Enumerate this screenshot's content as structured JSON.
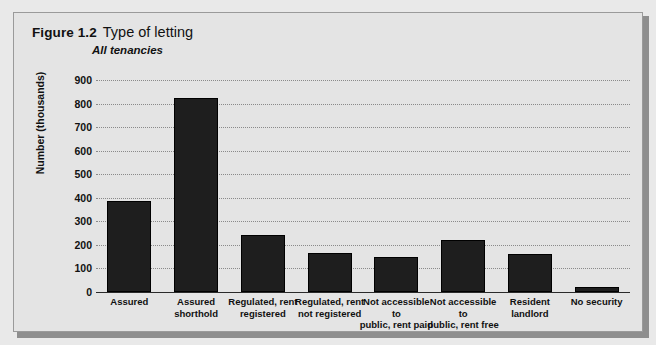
{
  "figure": {
    "number": "Figure 1.2",
    "title": "Type of letting",
    "subtitle": "All tenancies"
  },
  "colors": {
    "bar": "#1e1e1e",
    "panel_background": "#e4e4e4",
    "page_background": "#e9e9e9",
    "gridline": "#8a8a8a",
    "text": "#111111"
  },
  "chart_data": {
    "type": "bar",
    "title": "Type of letting",
    "subtitle": "All tenancies",
    "xlabel": "",
    "ylabel": "Number (thousands)",
    "ylim": [
      0,
      900
    ],
    "yticks": [
      0,
      100,
      200,
      300,
      400,
      500,
      600,
      700,
      800,
      900
    ],
    "ytick_labels": [
      "0",
      "100",
      "200",
      "300",
      "400",
      "500",
      "600",
      "700",
      "800",
      "900"
    ],
    "grid": true,
    "legend": false,
    "categories": [
      "Assured",
      "Assured shorthold",
      "Regulated, rent registered",
      "Regulated, rent not registered",
      "Not accessible to public, rent paid",
      "Not accessible to public, rent free",
      "Resident landlord",
      "No security"
    ],
    "category_lines": [
      [
        "Assured"
      ],
      [
        "Assured",
        "shorthold"
      ],
      [
        "Regulated, rent",
        "registered"
      ],
      [
        "Regulated, rent",
        "not registered"
      ],
      [
        "Not accessible to",
        "public, rent paid"
      ],
      [
        "Not accessible to",
        "public, rent free"
      ],
      [
        "Resident",
        "landlord"
      ],
      [
        "No security"
      ]
    ],
    "values": [
      385,
      825,
      240,
      165,
      150,
      220,
      160,
      20
    ]
  }
}
